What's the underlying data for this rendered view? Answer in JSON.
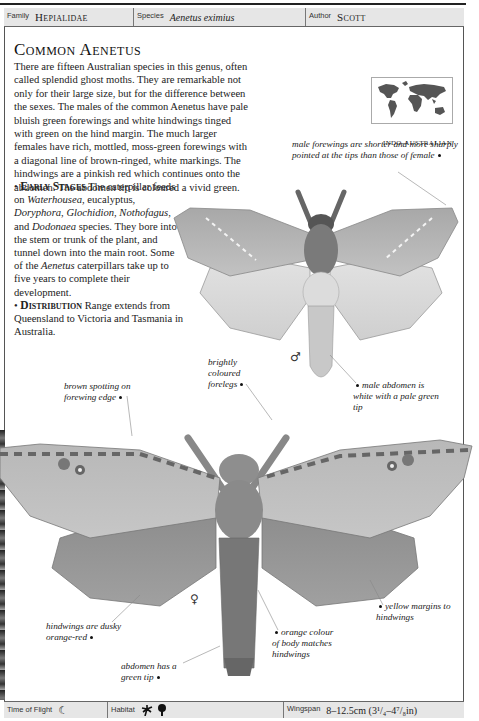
{
  "header": {
    "family_label": "Family",
    "family_value": "Hepialidae",
    "species_label": "Species",
    "species_value": "Aenetus eximius",
    "author_label": "Author",
    "author_value": "Scott"
  },
  "title": "Common Aenetus",
  "intro": "There are fifteen Australian species in this genus, often called splendid ghost moths. They are remarkable not only for their large size, but for the difference between the sexes. The males of the common Aenetus have pale bluish green forewings and white hindwings tinged with green on the hind margin. The much larger females have rich, mottled, moss-green forewings with a diagonal line of brown-ringed, white markings. The hindwings are a pinkish red which continues onto the abdomen. The abdomen tip is coloured a vivid green.",
  "early_stages": {
    "heading": "Early Stages",
    "text_1": " The caterpillar feeds on ",
    "plant_1": "Waterhousea",
    "text_2": ", eucalyptus, ",
    "plant_2": "Doryphora",
    "text_3": ", ",
    "plant_3": "Glochidion",
    "text_4": ", ",
    "plant_4": "Nothofagus",
    "text_5": ", and ",
    "plant_5": "Dodonaea",
    "text_6": " species. They bore into the stem or trunk of the plant, and tunnel down into the main root. Some of the ",
    "genus": "Aenetus",
    "text_7": " caterpillars take up to five years to complete their development."
  },
  "distribution": {
    "heading": "Distribution",
    "text": " Range extends from Queensland to Victoria and Tasmania in Australia."
  },
  "map": {
    "icon": "world-map-icon",
    "label": "INDO-AUSTRALIAN"
  },
  "annotations": {
    "male_forewings": "male forewings are shorter and more sharply pointed at the tips than those of female",
    "brightly_coloured": "brightly coloured forelegs",
    "male_abdomen": "male abdomen is white with a pale green tip",
    "brown_spotting": "brown spotting on forewing edge",
    "hindwings": "hindwings are dusky orange-red",
    "orange_colour": "orange colour of body matches hindwings",
    "yellow_margins": "yellow margins to hindwings",
    "abdomen_tip": "abdomen has a green tip"
  },
  "symbols": {
    "male": "♂",
    "female": "♀"
  },
  "footer": {
    "time_label": "Time of Flight",
    "time_icon": "crescent-moon-icon",
    "time_glyph": "☾",
    "habitat_label": "Habitat",
    "habitat_icons": [
      "palm-tree-icon",
      "deciduous-tree-icon"
    ],
    "wingspan_label": "Wingspan",
    "wingspan_value": "8–12.5cm (3¹/₄–4⁷/₈in)"
  },
  "colors": {
    "header_bg": "#e6e6e6",
    "border": "#555555",
    "text": "#222222"
  }
}
